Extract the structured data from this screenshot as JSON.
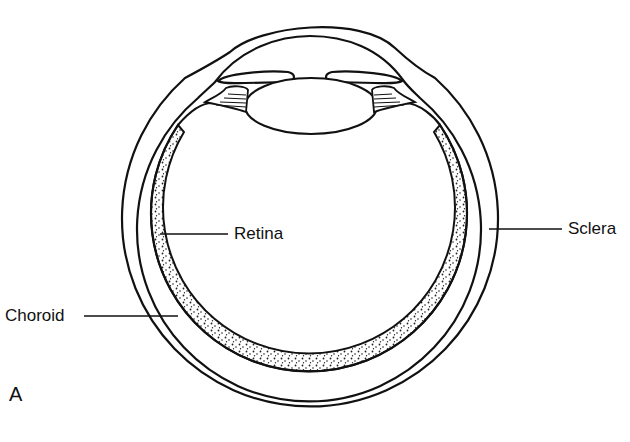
{
  "diagram": {
    "panel_label": "A",
    "labels": {
      "retina": "Retina",
      "sclera": "Sclera",
      "choroid": "Choroid"
    },
    "structures": [
      "cornea",
      "iris",
      "lens",
      "ciliary-body",
      "sclera",
      "choroid",
      "retina"
    ],
    "colors": {
      "line": "#111111",
      "background": "#ffffff",
      "stipple": "#222222"
    }
  }
}
